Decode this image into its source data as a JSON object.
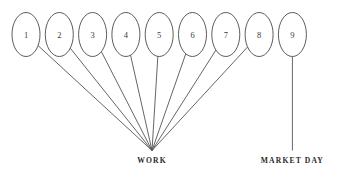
{
  "diagram": {
    "type": "tree-convergence-diagram",
    "background_color": "#ffffff",
    "line_color": "#545454",
    "node_stroke_color": "#4a4a4a",
    "text_color": "#2b2b2b",
    "canvas": {
      "width": 341,
      "height": 178
    },
    "nodes": [
      {
        "label": "1",
        "cx": 26.0,
        "cy": 34.5,
        "rx": 14.0,
        "ry": 22.0
      },
      {
        "label": "2",
        "cx": 59.3,
        "cy": 34.5,
        "rx": 14.0,
        "ry": 22.0
      },
      {
        "label": "3",
        "cx": 92.6,
        "cy": 34.5,
        "rx": 14.0,
        "ry": 22.0
      },
      {
        "label": "4",
        "cx": 125.9,
        "cy": 34.5,
        "rx": 14.0,
        "ry": 22.0
      },
      {
        "label": "5",
        "cx": 159.2,
        "cy": 34.5,
        "rx": 14.0,
        "ry": 22.0
      },
      {
        "label": "6",
        "cx": 192.5,
        "cy": 34.5,
        "rx": 14.0,
        "ry": 22.0
      },
      {
        "label": "7",
        "cx": 225.8,
        "cy": 34.5,
        "rx": 14.0,
        "ry": 22.0
      },
      {
        "label": "8",
        "cx": 259.1,
        "cy": 34.5,
        "rx": 14.0,
        "ry": 22.0
      },
      {
        "label": "9",
        "cx": 292.4,
        "cy": 34.5,
        "rx": 14.0,
        "ry": 22.0
      }
    ],
    "groups": [
      {
        "label": "WORK",
        "junction_x": 152.0,
        "junction_y": 150.5,
        "label_x": 152.0,
        "label_y": 163.0,
        "member_indexes": [
          0,
          1,
          2,
          3,
          4,
          5,
          6,
          7
        ]
      },
      {
        "label": "MARKET DAY",
        "junction_x": 292.4,
        "junction_y": 150.5,
        "label_x": 292.4,
        "label_y": 163.0,
        "member_indexes": [
          8
        ]
      }
    ]
  }
}
